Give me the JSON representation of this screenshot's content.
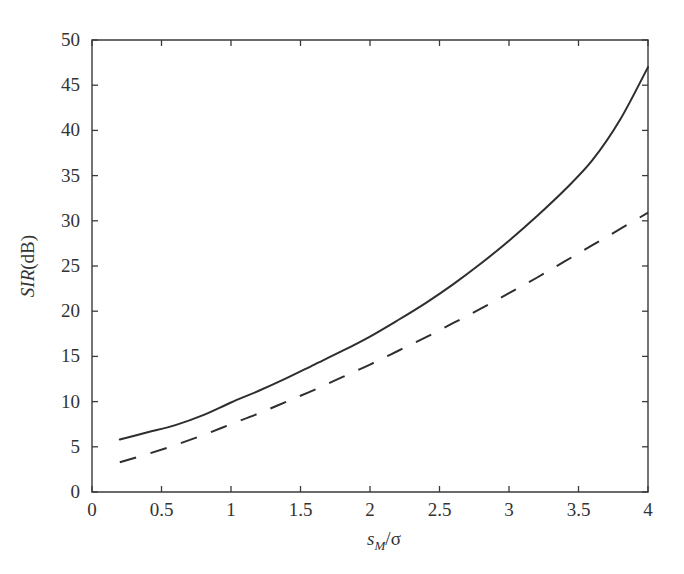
{
  "chart_data": {
    "type": "line",
    "title": "",
    "subtitle": "",
    "xlabel": "s_M/σ",
    "xlabel_parts": {
      "lead_italic": "s",
      "sub_italic": "M",
      "tail": "/σ"
    },
    "ylabel": "SIR(dB)",
    "ylabel_parts": {
      "lead_italic": "SIR",
      "tail": "(dB)"
    },
    "xlim": [
      0,
      4
    ],
    "ylim": [
      0,
      50
    ],
    "xticks": [
      0,
      0.5,
      1,
      1.5,
      2,
      2.5,
      3,
      3.5,
      4
    ],
    "xticklabels": [
      "0",
      "0.5",
      "1",
      "1.5",
      "2",
      "2.5",
      "3",
      "3.5",
      "4"
    ],
    "yticks": [
      0,
      5,
      10,
      15,
      20,
      25,
      30,
      35,
      40,
      45,
      50
    ],
    "yticklabels": [
      "0",
      "5",
      "10",
      "15",
      "20",
      "25",
      "30",
      "35",
      "40",
      "45",
      "50"
    ],
    "grid": false,
    "legend": null,
    "legend_position": "none",
    "annotations": [],
    "series": [
      {
        "name": "solid-curve",
        "style": "solid",
        "color": "#2e2e2e",
        "x": [
          0.2,
          0.4,
          0.6,
          0.8,
          1.0,
          1.2,
          1.4,
          1.6,
          1.8,
          2.0,
          2.2,
          2.4,
          2.6,
          2.8,
          3.0,
          3.2,
          3.4,
          3.6,
          3.8,
          4.0
        ],
        "y": [
          5.8,
          6.6,
          7.4,
          8.5,
          9.9,
          11.2,
          12.6,
          14.1,
          15.6,
          17.2,
          19.0,
          20.9,
          23.0,
          25.3,
          27.8,
          30.5,
          33.4,
          36.7,
          41.2,
          47.0
        ]
      },
      {
        "name": "dashed-curve",
        "style": "dashed",
        "color": "#2e2e2e",
        "x": [
          0.2,
          0.4,
          0.6,
          0.8,
          1.0,
          1.2,
          1.4,
          1.6,
          1.8,
          2.0,
          2.2,
          2.4,
          2.6,
          2.8,
          3.0,
          3.2,
          3.4,
          3.6,
          3.8,
          4.0
        ],
        "y": [
          3.3,
          4.2,
          5.2,
          6.3,
          7.5,
          8.7,
          10.0,
          11.3,
          12.7,
          14.1,
          15.6,
          17.1,
          18.7,
          20.3,
          22.0,
          23.7,
          25.5,
          27.3,
          29.1,
          30.9
        ]
      }
    ]
  },
  "figure": {
    "background_color": "#ffffff",
    "axis_color": "#3a3a3a"
  }
}
